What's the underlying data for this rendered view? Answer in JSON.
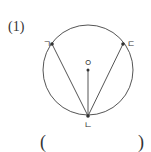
{
  "problem": {
    "number_label": "(1)"
  },
  "figure": {
    "circle": {
      "cx": 88,
      "cy": 70,
      "r": 45,
      "stroke": "#555555"
    },
    "points": [
      {
        "id": "giyeok",
        "label": "ㄱ",
        "x": 52,
        "y": 44,
        "label_x": 43,
        "label_y": 44
      },
      {
        "id": "nieun",
        "label": "ㄴ",
        "x": 88,
        "y": 116,
        "label_x": 85,
        "label_y": 127
      },
      {
        "id": "digeut",
        "label": "ㄷ",
        "x": 123,
        "y": 44,
        "label_x": 127,
        "label_y": 47
      },
      {
        "id": "center",
        "label": "ㅇ",
        "x": 88,
        "y": 70,
        "label_x": 85,
        "label_y": 66
      }
    ],
    "segments": [
      {
        "from": "giyeok",
        "to": "nieun"
      },
      {
        "from": "digeut",
        "to": "nieun"
      },
      {
        "from": "center",
        "to": "nieun"
      }
    ]
  },
  "answer": {
    "open_paren": "(",
    "close_paren": ")",
    "value": ""
  }
}
